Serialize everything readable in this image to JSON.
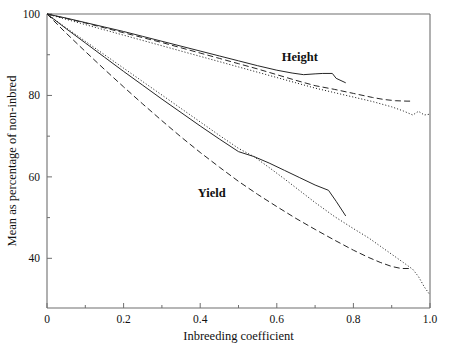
{
  "chart_data": {
    "type": "line",
    "title": "",
    "subtitle": "",
    "xlabel": "Inbreeding coefficient",
    "ylabel": "Mean as percentage of non-inbred",
    "xlim": [
      0,
      1.0
    ],
    "ylim": [
      27.8,
      100
    ],
    "grid": false,
    "legend_position": "inline-annotations",
    "x_ticks_major": [
      "0",
      "0.2",
      "0.4",
      "0.6",
      "0.8",
      "1.0"
    ],
    "x_ticks_major_values": [
      0,
      0.2,
      0.4,
      0.6,
      0.8,
      1.0
    ],
    "x_ticks_minor_values": [
      0.1,
      0.3,
      0.5,
      0.7,
      0.9
    ],
    "y_ticks_major": [
      "40",
      "60",
      "80",
      "100"
    ],
    "y_ticks_major_values": [
      40,
      60,
      80,
      100
    ],
    "y_ticks_minor_values": [
      50,
      70,
      90
    ],
    "annotations": [
      {
        "text": "Height",
        "x": 0.66,
        "y": 88.5
      },
      {
        "text": "Yield",
        "x": 0.43,
        "y": 55.0
      }
    ],
    "groups": [
      {
        "name": "Height",
        "series": [
          {
            "name": "Height solid",
            "style": "solid",
            "x": [
              0.0,
              0.05,
              0.1,
              0.15,
              0.2,
              0.25,
              0.3,
              0.35,
              0.4,
              0.45,
              0.5,
              0.55,
              0.6,
              0.64,
              0.67,
              0.7,
              0.72,
              0.745,
              0.755,
              0.78
            ],
            "y": [
              100.0,
              99.0,
              97.9,
              96.8,
              95.7,
              94.5,
              93.3,
              92.1,
              90.9,
              89.7,
              88.5,
              87.3,
              86.2,
              85.5,
              85.1,
              85.3,
              85.4,
              85.4,
              84.2,
              83.1
            ]
          },
          {
            "name": "Height dashed",
            "style": "dashed",
            "x": [
              0.0,
              0.05,
              0.1,
              0.15,
              0.2,
              0.25,
              0.3,
              0.35,
              0.4,
              0.45,
              0.5,
              0.55,
              0.6,
              0.65,
              0.7,
              0.75,
              0.8,
              0.85,
              0.88,
              0.91,
              0.94,
              0.955
            ],
            "y": [
              100.0,
              98.9,
              97.8,
              96.6,
              95.4,
              94.2,
              93.0,
              91.7,
              90.4,
              89.1,
              87.8,
              86.5,
              85.1,
              83.7,
              82.4,
              81.5,
              80.5,
              79.5,
              79.0,
              78.7,
              78.6,
              78.6
            ]
          },
          {
            "name": "Height dotted",
            "style": "dotted",
            "x": [
              0.0,
              0.05,
              0.1,
              0.15,
              0.2,
              0.25,
              0.3,
              0.35,
              0.4,
              0.45,
              0.5,
              0.55,
              0.6,
              0.65,
              0.7,
              0.75,
              0.8,
              0.85,
              0.9,
              0.93,
              0.955,
              0.97,
              0.985,
              1.0
            ],
            "y": [
              100.0,
              98.7,
              97.4,
              96.1,
              94.8,
              93.5,
              92.2,
              90.9,
              89.6,
              88.3,
              87.0,
              85.7,
              84.4,
              83.1,
              81.8,
              80.7,
              79.6,
              78.5,
              77.2,
              76.2,
              75.2,
              76.1,
              75.2,
              75.4
            ]
          }
        ]
      },
      {
        "name": "Yield",
        "series": [
          {
            "name": "Yield solid",
            "style": "solid",
            "x": [
              0.0,
              0.05,
              0.1,
              0.15,
              0.2,
              0.25,
              0.3,
              0.35,
              0.4,
              0.45,
              0.5,
              0.54,
              0.58,
              0.62,
              0.66,
              0.7,
              0.735,
              0.755,
              0.78
            ],
            "y": [
              100.0,
              96.4,
              92.9,
              89.4,
              85.9,
              82.5,
              79.1,
              75.8,
              72.5,
              69.3,
              66.2,
              65.0,
              63.4,
              61.6,
              59.8,
              58.0,
              56.7,
              54.0,
              50.4
            ]
          },
          {
            "name": "Yield dotted",
            "style": "dotted",
            "x": [
              0.0,
              0.05,
              0.1,
              0.15,
              0.2,
              0.25,
              0.3,
              0.35,
              0.4,
              0.45,
              0.5,
              0.54,
              0.58,
              0.62,
              0.66,
              0.7,
              0.75,
              0.8,
              0.84,
              0.87,
              0.9,
              0.93,
              0.955,
              0.97,
              0.985,
              1.0
            ],
            "y": [
              100.0,
              96.6,
              93.3,
              90.0,
              86.7,
              83.4,
              80.1,
              76.8,
              73.5,
              70.2,
              67.0,
              65.0,
              62.3,
              59.5,
              56.6,
              53.7,
              50.3,
              47.3,
              45.0,
              43.0,
              41.0,
              39.0,
              37.3,
              35.5,
              33.0,
              31.0
            ]
          },
          {
            "name": "Yield dashed",
            "style": "dashed",
            "x": [
              0.0,
              0.05,
              0.1,
              0.15,
              0.2,
              0.25,
              0.3,
              0.35,
              0.4,
              0.45,
              0.5,
              0.55,
              0.6,
              0.65,
              0.7,
              0.75,
              0.8,
              0.84,
              0.87,
              0.9,
              0.925,
              0.945
            ],
            "y": [
              100.0,
              95.3,
              90.8,
              86.4,
              82.1,
              77.9,
              73.8,
              69.8,
              66.0,
              62.4,
              58.9,
              55.7,
              52.7,
              49.8,
              47.1,
              44.5,
              42.0,
              40.2,
              39.0,
              38.0,
              37.5,
              37.5
            ]
          }
        ]
      }
    ]
  },
  "plot_geometry": {
    "left": 47,
    "right": 430,
    "top": 14,
    "bottom": 308
  }
}
